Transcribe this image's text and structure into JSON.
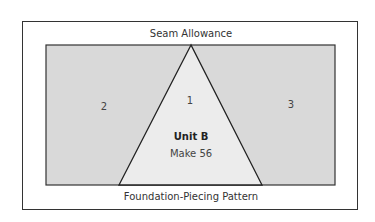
{
  "diagram": {
    "top_label": "Seam Allowance",
    "bottom_label": "Foundation-Piecing Pattern",
    "pieces": [
      {
        "number": "2",
        "region": "left"
      },
      {
        "number": "1",
        "region": "center-triangle"
      },
      {
        "number": "3",
        "region": "right"
      }
    ],
    "unit_title": "Unit B",
    "unit_quantity": "Make 56",
    "colors": {
      "outer_background": "#ffffff",
      "side_fill": "#d9d9d9",
      "triangle_fill": "#ececec",
      "stroke": "#222222"
    }
  }
}
